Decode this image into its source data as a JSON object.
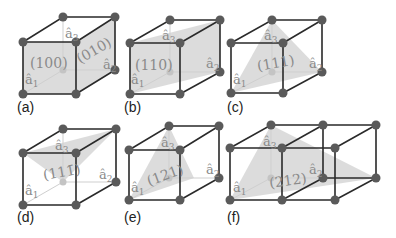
{
  "figure": {
    "colors": {
      "edge": "#2a2a2a",
      "plane_fill": "#d6d6d6",
      "node": "#5a5a5a",
      "label": "#8a8a8a"
    },
    "axis_labels": {
      "a1": "â",
      "a1_sub": "1",
      "a2": "â",
      "a2_sub": "2",
      "a3": "â",
      "a3_sub": "3"
    },
    "panels": [
      {
        "id": "a",
        "label": "(a)",
        "planes": [
          "(100)",
          "(010)"
        ]
      },
      {
        "id": "b",
        "label": "(b)",
        "planes": [
          "(110)"
        ]
      },
      {
        "id": "c",
        "label": "(c)",
        "planes": [
          "(111)"
        ]
      },
      {
        "id": "d",
        "label": "(d)",
        "planes": [
          "(111̄)"
        ]
      },
      {
        "id": "e",
        "label": "(e)",
        "planes": [
          "(121)"
        ]
      },
      {
        "id": "f",
        "label": "(f)",
        "planes": [
          "(212)"
        ]
      }
    ]
  }
}
